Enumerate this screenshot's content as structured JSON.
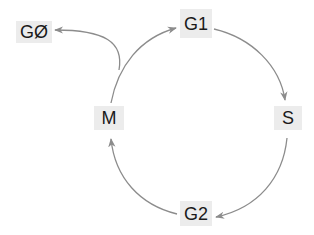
{
  "diagram": {
    "type": "cycle",
    "title": "",
    "edge_color": "#8c8c8c",
    "node_bg": "#ececec",
    "text_color": "#1a1a1a",
    "nodes": [
      {
        "id": "G0",
        "label": "GØ"
      },
      {
        "id": "G1",
        "label": "G1"
      },
      {
        "id": "S",
        "label": "S"
      },
      {
        "id": "G2",
        "label": "G2"
      },
      {
        "id": "M",
        "label": "M"
      }
    ],
    "edges": [
      {
        "from": "G1",
        "to": "S"
      },
      {
        "from": "S",
        "to": "G2"
      },
      {
        "from": "G2",
        "to": "M"
      },
      {
        "from": "M",
        "to": "G1"
      },
      {
        "from": "M",
        "to": "G0"
      }
    ]
  }
}
